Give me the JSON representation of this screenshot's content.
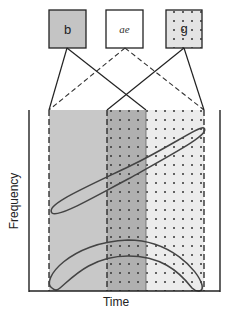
{
  "diagram": {
    "boxes": [
      {
        "label": "b",
        "fill": "#c4c4c4",
        "pattern": "none"
      },
      {
        "label": "ae",
        "fill": "#ffffff",
        "pattern": "none"
      },
      {
        "label": "g",
        "fill": "#e4e4e4",
        "pattern": "dots"
      }
    ],
    "axes": {
      "xlabel": "Time",
      "ylabel": "Frequency"
    },
    "regions": [
      {
        "name": "b-region",
        "fill": "#c8c8c8",
        "pattern": "none"
      },
      {
        "name": "overlap-region",
        "fill": "#b0b0b0",
        "pattern": "dots"
      },
      {
        "name": "g-region",
        "fill": "#ececec",
        "pattern": "dots"
      }
    ],
    "connectors": [
      {
        "from": "b",
        "to": "left-boundary",
        "style": "solid"
      },
      {
        "from": "b",
        "to": "overlap-right-boundary",
        "style": "solid"
      },
      {
        "from": "ae",
        "to": "left-boundary",
        "style": "dashed"
      },
      {
        "from": "ae",
        "to": "right-boundary",
        "style": "dashed"
      },
      {
        "from": "g",
        "to": "overlap-left-boundary",
        "style": "solid"
      },
      {
        "from": "g",
        "to": "right-boundary",
        "style": "solid"
      }
    ],
    "curves": [
      {
        "name": "rising-ellipse",
        "shape": "diagonal elongated ellipse"
      },
      {
        "name": "arch-band",
        "shape": "arched crescent band"
      }
    ]
  }
}
